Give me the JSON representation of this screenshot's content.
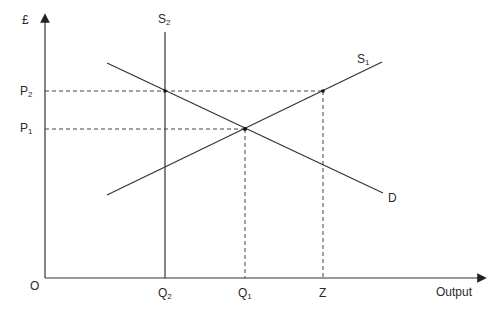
{
  "diagram": {
    "type": "supply-demand",
    "axes": {
      "y_label": "£",
      "x_label": "Output",
      "origin_label": "O"
    },
    "curves": [
      {
        "id": "S2",
        "label": "S",
        "sub": "2",
        "kind": "vertical supply"
      },
      {
        "id": "S1",
        "label": "S",
        "sub": "1",
        "kind": "upward supply"
      },
      {
        "id": "D",
        "label": "D",
        "sub": "",
        "kind": "downward demand"
      }
    ],
    "price_levels": [
      {
        "label": "P",
        "sub": "2"
      },
      {
        "label": "P",
        "sub": "1"
      }
    ],
    "quantity_levels": [
      {
        "label": "Q",
        "sub": "2"
      },
      {
        "label": "Q",
        "sub": "1"
      },
      {
        "label": "Z",
        "sub": ""
      }
    ]
  }
}
